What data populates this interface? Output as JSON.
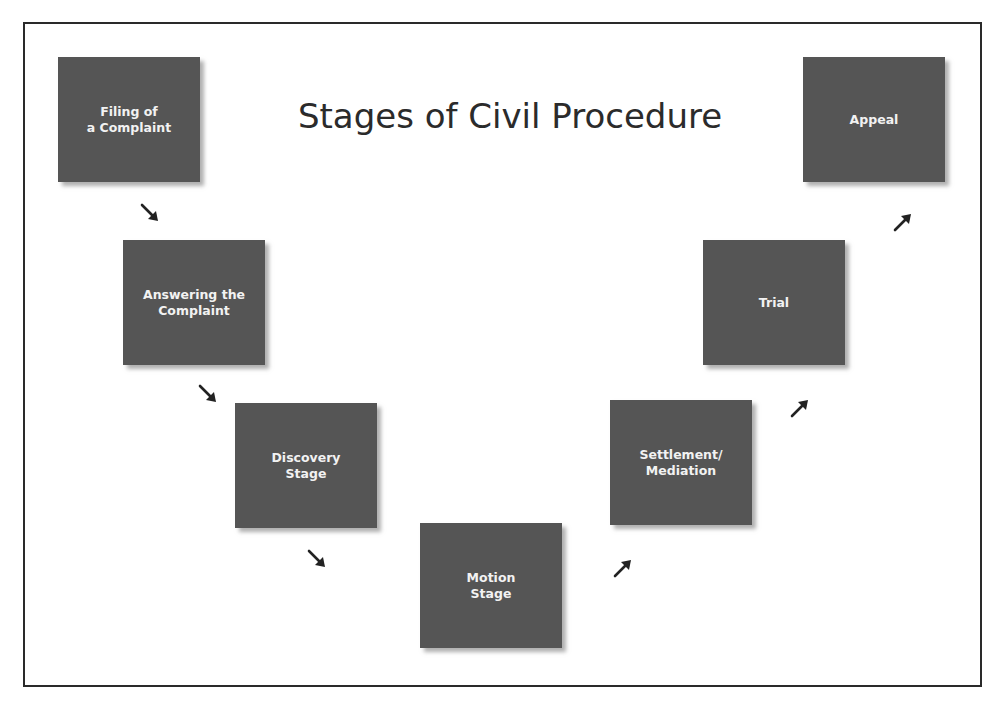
{
  "title": "Stages of Civil Procedure",
  "colors": {
    "box_fill": "#555555",
    "box_text": "#f2f2f2",
    "arrow": "#222222",
    "frame_border": "#2a2a2a",
    "title_text": "#2b2b2b"
  },
  "stages": [
    {
      "id": "filing",
      "label": "Filing of\na Complaint"
    },
    {
      "id": "answering",
      "label": "Answering the\nComplaint"
    },
    {
      "id": "discovery",
      "label": "Discovery\nStage"
    },
    {
      "id": "motion",
      "label": "Motion\nStage"
    },
    {
      "id": "settlement",
      "label": "Settlement/\nMediation"
    },
    {
      "id": "trial",
      "label": "Trial"
    },
    {
      "id": "appeal",
      "label": "Appeal"
    }
  ],
  "arrows": [
    {
      "from": "filing",
      "to": "answering",
      "direction": "down-right"
    },
    {
      "from": "answering",
      "to": "discovery",
      "direction": "down-right"
    },
    {
      "from": "discovery",
      "to": "motion",
      "direction": "down-right"
    },
    {
      "from": "motion",
      "to": "settlement",
      "direction": "up-right"
    },
    {
      "from": "settlement",
      "to": "trial",
      "direction": "up-right"
    },
    {
      "from": "trial",
      "to": "appeal",
      "direction": "up-right"
    }
  ]
}
